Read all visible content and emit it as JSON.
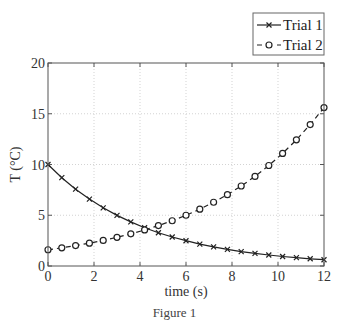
{
  "caption": "Figure 1",
  "chart_data": {
    "type": "line",
    "title": "",
    "xlabel": "time (s)",
    "ylabel": "T (°C)",
    "xlim": [
      0,
      12
    ],
    "ylim": [
      0,
      20
    ],
    "xticks": [
      0,
      2,
      4,
      6,
      8,
      10,
      12
    ],
    "yticks": [
      0,
      5,
      10,
      15,
      20
    ],
    "grid": true,
    "legend_position": "top-right (outside, above axes)",
    "x": [
      0,
      0.6,
      1.2,
      1.8,
      2.4,
      3.0,
      3.6,
      4.2,
      4.8,
      5.4,
      6.0,
      6.6,
      7.2,
      7.8,
      8.4,
      9.0,
      9.6,
      10.2,
      10.8,
      11.4,
      12.0
    ],
    "series": [
      {
        "name": "Trial 1",
        "line_style": "solid",
        "marker": "x",
        "color": "#222222",
        "values": [
          10.0,
          8.7,
          7.57,
          6.59,
          5.73,
          4.99,
          4.34,
          3.77,
          3.28,
          2.86,
          2.49,
          2.16,
          1.88,
          1.64,
          1.42,
          1.24,
          1.08,
          0.94,
          0.82,
          0.71,
          0.62
        ]
      },
      {
        "name": "Trial 2",
        "line_style": "dashed",
        "marker": "o",
        "color": "#222222",
        "values": [
          1.6,
          1.79,
          2.01,
          2.25,
          2.52,
          2.83,
          3.17,
          3.55,
          3.98,
          4.46,
          5.0,
          5.6,
          6.28,
          7.03,
          7.88,
          8.83,
          9.9,
          11.09,
          12.43,
          13.93,
          15.61
        ]
      }
    ]
  }
}
